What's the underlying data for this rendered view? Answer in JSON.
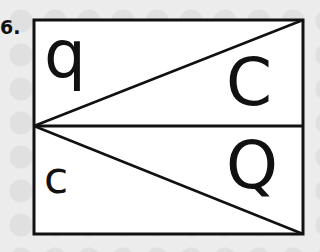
{
  "exercise": {
    "number": "6.",
    "top_panel": {
      "left_letter": "q",
      "right_letter": "C"
    },
    "bottom_panel": {
      "left_letter": "c",
      "right_letter": "Q"
    }
  },
  "colors": {
    "stroke": "#111111",
    "panel_fill": "#ffffff",
    "background": "#ececec"
  }
}
